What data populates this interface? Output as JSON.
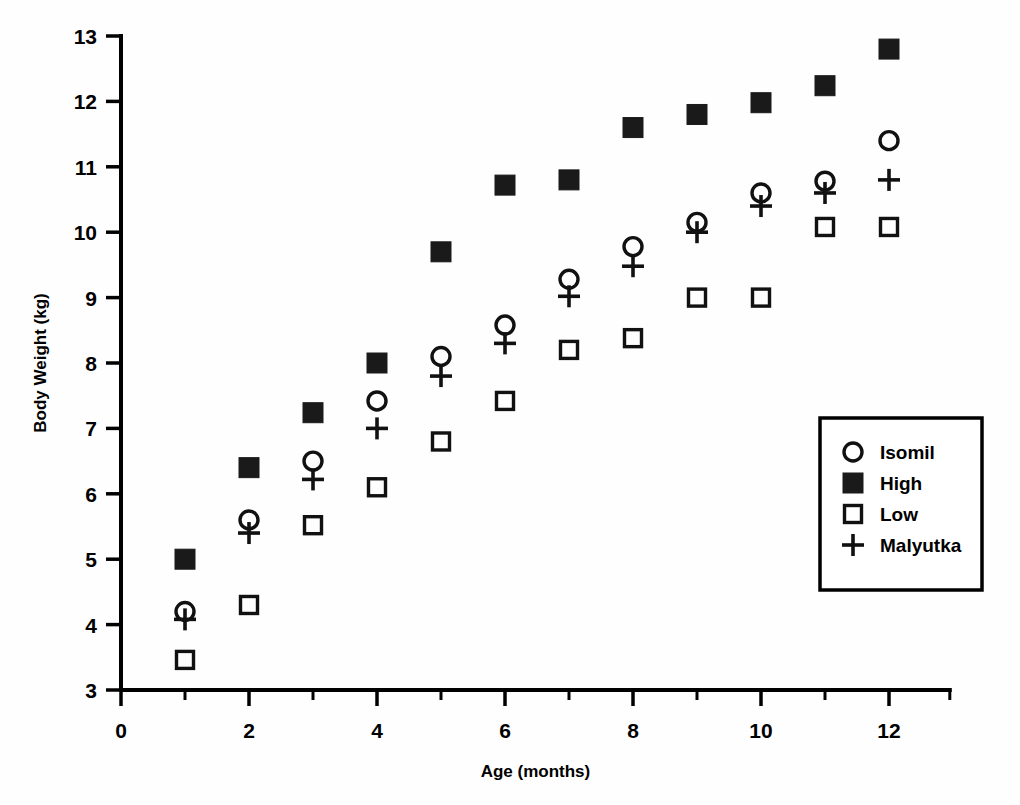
{
  "chart_data": {
    "type": "scatter",
    "title": "",
    "xlabel": "Age (months)",
    "ylabel": "Body Weight (kg)",
    "xlim": [
      0,
      12.95
    ],
    "ylim": [
      3,
      13
    ],
    "grid": false,
    "legend_position": "bottom-right",
    "x_ticks_major": [
      0,
      2,
      4,
      6,
      8,
      10,
      12
    ],
    "x_ticks_minor": [
      1,
      3,
      5,
      7,
      9,
      11
    ],
    "x_tick_labels": [
      "0",
      "2",
      "4",
      "6",
      "8",
      "10",
      "12"
    ],
    "y_ticks_major": [
      3,
      4,
      5,
      6,
      7,
      8,
      9,
      10,
      11,
      12,
      13
    ],
    "y_tick_labels": [
      "3",
      "4",
      "5",
      "6",
      "7",
      "8",
      "9",
      "10",
      "11",
      "12",
      "13"
    ],
    "x": [
      1,
      2,
      3,
      4,
      5,
      6,
      7,
      8,
      9,
      10,
      11,
      12
    ],
    "series": [
      {
        "name": "Isomil",
        "marker": "open-circle",
        "values": [
          4.2,
          5.6,
          6.5,
          7.42,
          8.1,
          8.58,
          9.28,
          9.78,
          10.15,
          10.6,
          10.78,
          11.4
        ]
      },
      {
        "name": "High",
        "marker": "filled-square",
        "values": [
          5.0,
          6.4,
          7.24,
          8.0,
          9.7,
          10.72,
          10.8,
          11.6,
          11.8,
          11.98,
          12.24,
          12.8
        ]
      },
      {
        "name": "Low",
        "marker": "open-square",
        "values": [
          3.46,
          4.3,
          5.52,
          6.1,
          6.8,
          7.42,
          8.2,
          8.38,
          9.0,
          9.0,
          10.08,
          10.08
        ]
      },
      {
        "name": "Malyutka",
        "marker": "plus",
        "values": [
          4.08,
          5.4,
          6.22,
          7.0,
          7.8,
          8.3,
          9.02,
          9.48,
          10.0,
          10.4,
          10.6,
          10.8
        ]
      }
    ]
  },
  "legend": {
    "entries": [
      {
        "label": "Isomil",
        "marker": "open-circle"
      },
      {
        "label": "High",
        "marker": "filled-square"
      },
      {
        "label": "Low",
        "marker": "open-square"
      },
      {
        "label": "Malyutka",
        "marker": "plus"
      }
    ]
  },
  "colors": {
    "ink": "#000000",
    "marker": "#1a1a1a",
    "background": "#ffffff"
  }
}
